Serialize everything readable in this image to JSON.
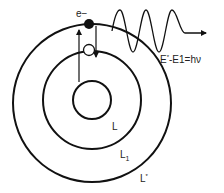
{
  "labels": {
    "electron": "e−",
    "equation_prefix": "E",
    "equation_sup": "*",
    "equation_suffix": "-E1=hν",
    "orbit_inner": "L",
    "orbit_middle": "L",
    "orbit_middle_sub": "1",
    "orbit_outer": "L",
    "orbit_outer_sup": "*"
  },
  "colors": {
    "stroke": "#111111",
    "text": "#222222",
    "background": "#ffffff"
  }
}
